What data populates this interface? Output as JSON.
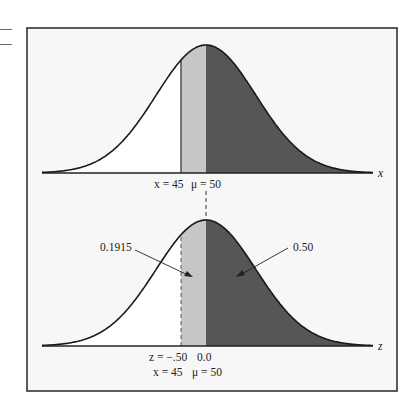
{
  "figure": {
    "frame_color": "#333333",
    "frame_fill": "#f7f7f7",
    "colors": {
      "curve": "#1a1a1a",
      "left_region": "#ffffff",
      "middle_region": "#c6c6c6",
      "right_region": "#565656",
      "dashed_line": "#333333"
    },
    "upper_panel": {
      "axis_label": "x",
      "tick_labels": {
        "x_value": "x = 45",
        "mean": "μ = 50"
      }
    },
    "lower_panel": {
      "axis_label": "z",
      "tick_labels_row1": {
        "z_value": "z = −.50",
        "z_mean": "0.0"
      },
      "tick_labels_row2": {
        "x_value": "x = 45",
        "mean": "μ = 50"
      },
      "annotations": {
        "middle_area": "0.1915",
        "right_area": "0.50"
      }
    }
  },
  "chart_data": {
    "type": "area",
    "title": "",
    "panels": [
      {
        "axis": "x",
        "mean": 50,
        "marked_value": 45,
        "tick_labels": [
          "x = 45",
          "μ = 50"
        ],
        "shaded_regions": [
          {
            "from": 45,
            "to": 50,
            "shade": "light"
          },
          {
            "from": 50,
            "to": "inf",
            "shade": "dark"
          }
        ]
      },
      {
        "axis": "z",
        "mean": 0.0,
        "marked_value": -0.5,
        "tick_labels": [
          "z = −.50",
          "0.0",
          "x = 45",
          "μ = 50"
        ],
        "shaded_regions": [
          {
            "from": -0.5,
            "to": 0.0,
            "shade": "light",
            "area": 0.1915
          },
          {
            "from": 0.0,
            "to": "inf",
            "shade": "dark",
            "area": 0.5
          }
        ]
      }
    ]
  }
}
